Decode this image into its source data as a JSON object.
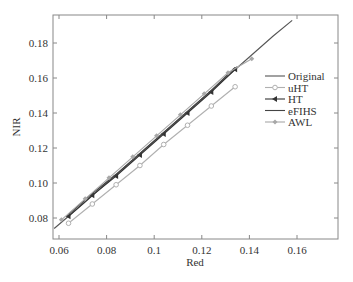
{
  "chart_data": {
    "type": "line",
    "title": "",
    "xlabel": "Red",
    "ylabel": "NIR",
    "xlim": [
      0.057,
      0.176
    ],
    "ylim": [
      0.07,
      0.194
    ],
    "xticks": [
      0.06,
      0.08,
      0.1,
      0.12,
      0.14,
      0.16
    ],
    "xtick_labels": [
      "0.06",
      "0.08",
      "0.1",
      "0.12",
      "0.14",
      "0.16"
    ],
    "yticks": [
      0.08,
      0.1,
      0.12,
      0.14,
      0.16,
      0.18
    ],
    "ytick_labels": [
      "0.08",
      "0.10",
      "0.12",
      "0.14",
      "0.16",
      "0.18"
    ],
    "grid": false,
    "legend_position": "right-center inside",
    "series": [
      {
        "name": "Original",
        "color": "#555555",
        "marker": "none",
        "x": [
          0.058,
          0.07,
          0.08,
          0.09,
          0.1,
          0.11,
          0.12,
          0.13,
          0.14,
          0.15,
          0.158
        ],
        "y": [
          0.074,
          0.088,
          0.1,
          0.112,
          0.124,
          0.136,
          0.148,
          0.16,
          0.172,
          0.184,
          0.193
        ]
      },
      {
        "name": "uHT",
        "color": "#b0b0b0",
        "marker": "circle",
        "x": [
          0.064,
          0.074,
          0.084,
          0.094,
          0.104,
          0.114,
          0.124,
          0.134
        ],
        "y": [
          0.077,
          0.088,
          0.099,
          0.11,
          0.122,
          0.133,
          0.144,
          0.155
        ]
      },
      {
        "name": "HT",
        "color": "#333333",
        "marker": "triangle-left",
        "x": [
          0.064,
          0.074,
          0.084,
          0.094,
          0.104,
          0.114,
          0.124,
          0.134
        ],
        "y": [
          0.081,
          0.093,
          0.104,
          0.116,
          0.128,
          0.14,
          0.152,
          0.165
        ]
      },
      {
        "name": "eFIHS",
        "color": "#444444",
        "marker": "none",
        "x": [
          0.064,
          0.074,
          0.084,
          0.094,
          0.104,
          0.114,
          0.124,
          0.134
        ],
        "y": [
          0.082,
          0.094,
          0.105,
          0.117,
          0.129,
          0.141,
          0.153,
          0.166
        ]
      },
      {
        "name": "AWL",
        "color": "#a8a8a8",
        "marker": "diamond",
        "x": [
          0.061,
          0.071,
          0.081,
          0.091,
          0.101,
          0.111,
          0.121,
          0.131,
          0.141
        ],
        "y": [
          0.079,
          0.091,
          0.103,
          0.115,
          0.127,
          0.139,
          0.151,
          0.163,
          0.171
        ]
      }
    ]
  }
}
